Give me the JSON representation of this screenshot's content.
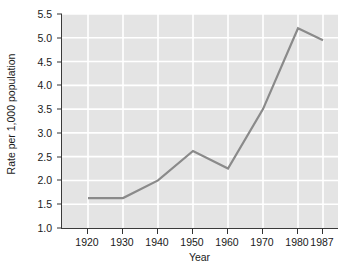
{
  "chart_data": {
    "type": "line",
    "title": "",
    "xlabel": "Year",
    "ylabel": "Rate per 1,000 population",
    "x": [
      1920,
      1930,
      1940,
      1950,
      1960,
      1970,
      1980,
      1987
    ],
    "x_tick_labels": [
      "1920",
      "1930",
      "1940",
      "1950",
      "1960",
      "1970",
      "1980",
      "1987"
    ],
    "x_tick_positions_px": [
      26,
      61,
      96,
      131,
      166,
      201,
      236,
      261
    ],
    "values": [
      1.63,
      1.63,
      2.0,
      2.62,
      2.25,
      3.5,
      5.2,
      4.95
    ],
    "series": [
      {
        "name": "Rate per 1,000 population",
        "values": [
          1.63,
          1.63,
          2.0,
          2.62,
          2.25,
          3.5,
          5.2,
          4.95
        ]
      }
    ],
    "ylim": [
      1.0,
      5.5
    ],
    "y_ticks": [
      1.0,
      1.5,
      2.0,
      2.5,
      3.0,
      3.5,
      4.0,
      4.5,
      5.0,
      5.5
    ],
    "y_tick_labels": [
      "1.0",
      "1.5",
      "2.0",
      "2.5",
      "3.0",
      "3.5",
      "4.0",
      "4.5",
      "5.0",
      "5.5"
    ],
    "grid": true,
    "grid_color": "#ffffff",
    "legend": false,
    "legend_position": "none",
    "plot_background": "#e4e4e4",
    "line_color": "#8a8a8a",
    "axis_color": "#3a3a3a",
    "text_color": "#1a1a1a"
  }
}
